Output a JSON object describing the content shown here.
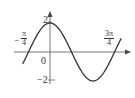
{
  "chart_data": {
    "type": "line",
    "title": "",
    "xlabel": "",
    "ylabel": "",
    "function": "y = 2cos(2x)",
    "xlim": [
      -1.0,
      2.6
    ],
    "ylim": [
      -2,
      2
    ],
    "x_ticks": [
      {
        "value": -0.785,
        "label_num": "π",
        "label_den": "4",
        "sign": "−"
      },
      {
        "value": 0,
        "label": "0"
      },
      {
        "value": 2.356,
        "label_num": "3π",
        "label_den": "4",
        "sign": ""
      }
    ],
    "y_ticks": [
      {
        "value": 2,
        "label": "2"
      },
      {
        "value": -2,
        "label": "−2"
      }
    ],
    "x": [
      -0.95,
      -0.785,
      -0.39,
      0,
      0.39,
      0.785,
      1.18,
      1.571,
      1.96,
      2.356,
      2.6
    ],
    "y": [
      -0.65,
      0,
      1.41,
      2,
      1.41,
      0,
      -1.41,
      -2,
      -1.41,
      0,
      1.2
    ],
    "grid": false,
    "legend": null
  },
  "labels": {
    "y_top": "2",
    "y_bottom": "−2",
    "origin": "0",
    "neg_sign": "−",
    "left_num": "π",
    "left_den": "4",
    "right_num": "3π",
    "right_den": "4"
  },
  "colors": {
    "curve": "#333333",
    "axis": "#555555"
  }
}
